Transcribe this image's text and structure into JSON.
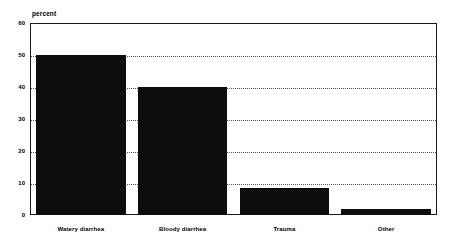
{
  "chart_data": {
    "type": "bar",
    "title": "",
    "subtitle": "",
    "xlabel": "",
    "ylabel": "percent",
    "ylim": [
      0,
      60
    ],
    "ytick_labels": [
      "0",
      "10",
      "20",
      "30",
      "40",
      "50",
      "60"
    ],
    "ytick_values": [
      0,
      10,
      20,
      30,
      40,
      50,
      60
    ],
    "grid": "horizontal dotted gridlines at 10, 20, 30, 40, 50",
    "legend": "none",
    "categories": [
      "Watery diarrhea",
      "Bloody diarrhea",
      "Trauma",
      "Other"
    ],
    "values": [
      50,
      40,
      8.5,
      2
    ],
    "bar_color": "#0d0d0d",
    "frame_color": "#1a1a1a",
    "gridline_color": "#555555",
    "background_color": "#ffffff"
  },
  "axis": {
    "unit_label": "percent"
  }
}
